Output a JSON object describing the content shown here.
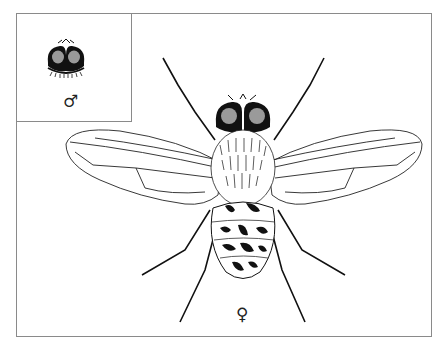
{
  "figure": {
    "inset_label": "♂",
    "main_label": "♀",
    "colors": {
      "ink": "#111111",
      "frame": "#8a8a8a",
      "background": "#ffffff"
    }
  }
}
